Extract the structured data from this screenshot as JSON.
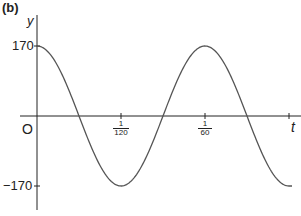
{
  "panel_label": "(b)",
  "chart_data": {
    "type": "line",
    "title": "(b)",
    "xlabel": "t",
    "ylabel": "y",
    "origin_label": "O",
    "function": "y = 170 cos(120πt)",
    "amplitude": 170,
    "period": "1/60",
    "x_ticks": [
      {
        "value": 0.008333,
        "label_num": "1",
        "label_den": "120"
      },
      {
        "value": 0.016667,
        "label_num": "1",
        "label_den": "60"
      },
      {
        "value": 0.025,
        "label_num": "",
        "label_den": ""
      }
    ],
    "y_ticks": [
      {
        "value": 170,
        "label": "170"
      },
      {
        "value": -170,
        "label": "−170"
      }
    ],
    "x": [
      0,
      0.004167,
      0.008333,
      0.0125,
      0.016667,
      0.020833,
      0.025
    ],
    "series": [
      {
        "name": "y",
        "values": [
          170,
          0,
          -170,
          0,
          170,
          0,
          -170
        ]
      }
    ],
    "xlim": [
      0,
      0.026
    ],
    "ylim": [
      -200,
      200
    ],
    "grid": false,
    "legend": null
  },
  "colors": {
    "axis": "#222222",
    "curve": "#555555"
  }
}
